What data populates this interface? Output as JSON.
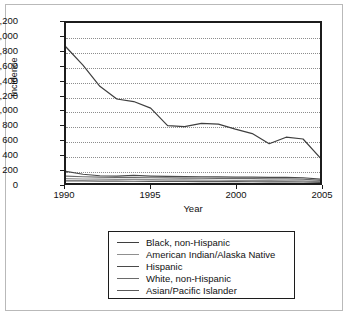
{
  "chart_data": {
    "type": "line",
    "title": "",
    "xlabel": "Year",
    "ylabel": "Incidence",
    "xlim": [
      1990,
      2005
    ],
    "ylim": [
      0,
      2200
    ],
    "ytick_step": 200,
    "grid": true,
    "legend_position": "bottom",
    "x": [
      1990,
      1991,
      1992,
      1993,
      1994,
      1995,
      1996,
      1997,
      1998,
      1999,
      2000,
      2001,
      2002,
      2003,
      2004,
      2005
    ],
    "xtick_labels": [
      "1990",
      "1995",
      "2000",
      "2005"
    ],
    "xtick_values": [
      1990,
      1995,
      2000,
      2005
    ],
    "ytick_labels": [
      "0",
      "200",
      "400",
      "600",
      "800",
      "1,000",
      "1,200",
      "1,400",
      "1,600",
      "1,800",
      "2,000",
      "2,200"
    ],
    "ytick_values": [
      0,
      200,
      400,
      600,
      800,
      1000,
      1200,
      1400,
      1600,
      1800,
      2000,
      2200
    ],
    "series": [
      {
        "name": "Black, non-Hispanic",
        "color": "#3f3f3f",
        "values": [
          1870,
          1620,
          1330,
          1155,
          1120,
          1030,
          790,
          775,
          820,
          810,
          740,
          680,
          540,
          630,
          605,
          350
        ]
      },
      {
        "name": "American Indian/Alaska Native",
        "color": "#8f8f8f",
        "values": [
          60,
          55,
          52,
          50,
          48,
          46,
          44,
          42,
          40,
          38,
          36,
          34,
          32,
          30,
          28,
          18
        ]
      },
      {
        "name": "Hispanic",
        "color": "#4a4a4a",
        "values": [
          160,
          120,
          100,
          95,
          105,
          95,
          90,
          88,
          86,
          84,
          82,
          80,
          78,
          76,
          72,
          52
        ]
      },
      {
        "name": "White, non-Hispanic",
        "color": "#6a6a6a",
        "values": [
          95,
          86,
          80,
          76,
          74,
          72,
          70,
          68,
          66,
          64,
          62,
          60,
          58,
          56,
          54,
          36
        ]
      },
      {
        "name": "Asian/Pacific Islander",
        "color": "#5a5a5a",
        "values": [
          30,
          28,
          26,
          25,
          24,
          23,
          22,
          21,
          20,
          19,
          18,
          17,
          16,
          15,
          14,
          8
        ]
      }
    ]
  },
  "axes": {
    "y_title": "Incidence",
    "x_title": "Year"
  }
}
